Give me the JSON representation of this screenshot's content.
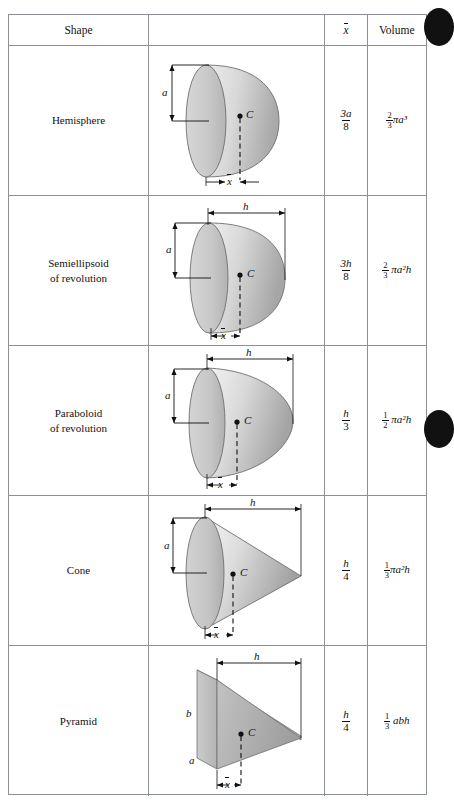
{
  "table": {
    "headers": {
      "shape": "Shape",
      "figure": "",
      "xbar": "x̄",
      "volume": "Volume"
    },
    "rows": [
      {
        "id": "hemisphere",
        "name": "Hemisphere",
        "figure": "hemisphere",
        "labels": {
          "a": "a",
          "h": "",
          "b": "",
          "c": "C",
          "xbar": "x̄"
        },
        "xbar_num": "3a",
        "xbar_den": "8",
        "volume_num": "2",
        "volume_den": "3",
        "volume_expr": "πa³"
      },
      {
        "id": "semiellipsoid",
        "name": "Semiellipsoid\nof revolution",
        "figure": "semiellipsoid",
        "labels": {
          "a": "a",
          "h": "h",
          "b": "",
          "c": "C",
          "xbar": "x̄"
        },
        "xbar_num": "3h",
        "xbar_den": "8",
        "volume_num": "2",
        "volume_den": "3",
        "volume_expr": "πa²h"
      },
      {
        "id": "paraboloid",
        "name": "Paraboloid\nof revolution",
        "figure": "paraboloid",
        "labels": {
          "a": "a",
          "h": "h",
          "b": "",
          "c": "C",
          "xbar": "x̄"
        },
        "xbar_num": "h",
        "xbar_den": "3",
        "volume_num": "1",
        "volume_den": "2",
        "volume_expr": "πa²h"
      },
      {
        "id": "cone",
        "name": "Cone",
        "figure": "cone",
        "labels": {
          "a": "a",
          "h": "h",
          "b": "",
          "c": "C",
          "xbar": "x̄"
        },
        "xbar_num": "h",
        "xbar_den": "4",
        "volume_num": "1",
        "volume_den": "3",
        "volume_expr": "πa²h"
      },
      {
        "id": "pyramid",
        "name": "Pyramid",
        "figure": "pyramid",
        "labels": {
          "a": "a",
          "h": "h",
          "b": "b",
          "c": "C",
          "xbar": "x̄"
        },
        "xbar_num": "h",
        "xbar_den": "4",
        "volume_num": "1",
        "volume_den": "3",
        "volume_expr": "abh"
      }
    ]
  },
  "colors": {
    "grid": "#8c9196",
    "solid_light": "#e3e3e3",
    "solid_mid": "#c6c6c6",
    "solid_dark": "#a8a8a8",
    "ink": "#111111"
  },
  "caption": "",
  "edge_markers": 2
}
